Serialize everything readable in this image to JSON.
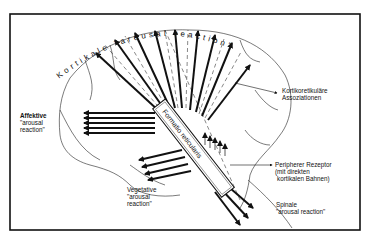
{
  "diagram": {
    "arc_title": "Kortikale \"arousal reaction\"",
    "box_label": "Formatio reticularis",
    "labels": {
      "kortikoretikulaere": [
        "Kortikoretikuläre",
        "Assoziationen"
      ],
      "affektive": [
        "Affektive",
        "\"arousal",
        "reaction\""
      ],
      "vegetative": [
        "Vegetative",
        "\"arousal",
        "reaction\""
      ],
      "peripherer": [
        "Peripherer Rezeptor",
        "(mit direkten",
        "kortikalen Bahnen)"
      ],
      "spinale": [
        "Spinale",
        "\"arousal reaction\""
      ]
    },
    "colors": {
      "ink": "#111111",
      "paper": "#ffffff"
    }
  }
}
